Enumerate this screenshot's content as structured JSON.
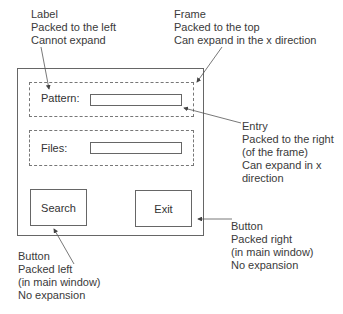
{
  "annotations": {
    "label": [
      "Label",
      "Packed to the left",
      "Cannot expand"
    ],
    "frame": [
      "Frame",
      "Packed to the top",
      "Can expand in the x direction"
    ],
    "entry": [
      "Entry",
      "Packed to the right",
      "(of the frame)",
      "Can expand in x",
      "direction"
    ],
    "button_right": [
      "Button",
      "Packed right",
      "(in main window)",
      "No expansion"
    ],
    "button_left": [
      "Button",
      "Packed left",
      "(in main window)",
      "No expansion"
    ]
  },
  "window": {
    "pattern_label": "Pattern:",
    "files_label": "Files:",
    "pattern_value": "",
    "files_value": "",
    "search_button": "Search",
    "exit_button": "Exit"
  },
  "colors": {
    "line": "#666666",
    "text": "#333333"
  }
}
